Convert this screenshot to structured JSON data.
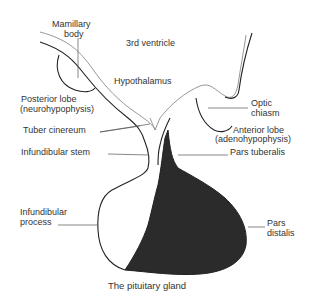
{
  "diagram": {
    "title": "The pituitary gland",
    "labels": {
      "mamillary_body_1": "Mamillary",
      "mamillary_body_2": "body",
      "third_ventricle": "3rd ventricle",
      "hypothalamus": "Hypothalamus",
      "posterior_lobe_1": "Posterior lobe",
      "posterior_lobe_2": "(neurohypophysis)",
      "optic_chiasm_1": "Optic",
      "optic_chiasm_2": "chiasm",
      "tuber_cinereum": "Tuber cinereum",
      "anterior_lobe_1": "Anterior lobe",
      "anterior_lobe_2": "(adenohypophysis)",
      "infundibular_stem": "Infundibular stem",
      "pars_tuberalis": "Pars tuberalis",
      "infundibular_process_1": "Infundibular",
      "infundibular_process_2": "process",
      "pars_distalis_1": "Pars",
      "pars_distalis_2": "distalis"
    },
    "colors": {
      "anterior_fill": "#2b2b2b",
      "outline": "#222222",
      "background": "#ffffff"
    }
  }
}
